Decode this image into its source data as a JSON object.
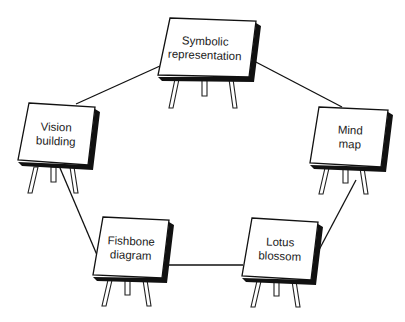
{
  "diagram": {
    "type": "cycle",
    "description_visible": "",
    "colors": {
      "line": "#111111",
      "board_fill": "#ffffff",
      "shadow": "#111111",
      "text": "#222222"
    },
    "nodes": [
      {
        "id": "symbolic",
        "line1": "Symbolic",
        "line2": "representation",
        "label_x": 205,
        "label_y": 48,
        "board": [
          [
            170,
            18
          ],
          [
            256,
            21
          ],
          [
            249,
            77
          ],
          [
            158,
            75
          ]
        ],
        "legs": [
          [
            [
              175,
              79
            ],
            [
              179,
              79
            ],
            [
              173,
              108
            ],
            [
              169,
              108
            ]
          ],
          [
            [
              202,
              79
            ],
            [
              207,
              79
            ],
            [
              207,
              96
            ],
            [
              202,
              96
            ]
          ],
          [
            [
              229,
              79
            ],
            [
              233,
              79
            ],
            [
              237,
              108
            ],
            [
              233,
              108
            ]
          ]
        ]
      },
      {
        "id": "mind",
        "line1": "Mind",
        "line2": "map",
        "label_x": 350,
        "label_y": 137,
        "board": [
          [
            319,
            107
          ],
          [
            388,
            110
          ],
          [
            381,
            167
          ],
          [
            310,
            163
          ]
        ],
        "legs": [
          [
            [
              325,
              168
            ],
            [
              329,
              168
            ],
            [
              323,
              194
            ],
            [
              319,
              194
            ]
          ],
          [
            [
              343,
              168
            ],
            [
              348,
              168
            ],
            [
              348,
              183
            ],
            [
              343,
              183
            ]
          ],
          [
            [
              360,
              168
            ],
            [
              364,
              168
            ],
            [
              368,
              194
            ],
            [
              364,
              194
            ]
          ]
        ]
      },
      {
        "id": "lotus",
        "line1": "Lotus",
        "line2": "blossom",
        "label_x": 280,
        "label_y": 249,
        "board": [
          [
            252,
            218
          ],
          [
            318,
            222
          ],
          [
            311,
            280
          ],
          [
            242,
            276
          ]
        ],
        "legs": [
          [
            [
              257,
              281
            ],
            [
              261,
              281
            ],
            [
              255,
              307
            ],
            [
              251,
              307
            ]
          ],
          [
            [
              274,
              281
            ],
            [
              279,
              281
            ],
            [
              279,
              296
            ],
            [
              274,
              296
            ]
          ],
          [
            [
              292,
              281
            ],
            [
              296,
              281
            ],
            [
              300,
              307
            ],
            [
              296,
              307
            ]
          ]
        ]
      },
      {
        "id": "fishbone",
        "line1": "Fishbone",
        "line2": "diagram",
        "label_x": 131,
        "label_y": 248,
        "board": [
          [
            103,
            217
          ],
          [
            169,
            220
          ],
          [
            162,
            278
          ],
          [
            93,
            275
          ]
        ],
        "legs": [
          [
            [
              108,
              280
            ],
            [
              112,
              280
            ],
            [
              106,
              306
            ],
            [
              102,
              306
            ]
          ],
          [
            [
              125,
              280
            ],
            [
              130,
              280
            ],
            [
              130,
              295
            ],
            [
              125,
              295
            ]
          ],
          [
            [
              143,
              280
            ],
            [
              147,
              280
            ],
            [
              151,
              306
            ],
            [
              147,
              306
            ]
          ]
        ]
      },
      {
        "id": "vision",
        "line1": "Vision",
        "line2": "building",
        "label_x": 56,
        "label_y": 134,
        "board": [
          [
            29,
            103
          ],
          [
            95,
            107
          ],
          [
            88,
            165
          ],
          [
            18,
            160
          ]
        ],
        "legs": [
          [
            [
              34,
              167
            ],
            [
              38,
              167
            ],
            [
              32,
              193
            ],
            [
              28,
              193
            ]
          ],
          [
            [
              51,
              167
            ],
            [
              56,
              167
            ],
            [
              56,
              182
            ],
            [
              51,
              182
            ]
          ],
          [
            [
              70,
              167
            ],
            [
              74,
              167
            ],
            [
              78,
              193
            ],
            [
              74,
              193
            ]
          ]
        ]
      }
    ],
    "edges": [
      {
        "from": "vision",
        "to": "symbolic",
        "x1": 76,
        "y1": 104,
        "x2": 160,
        "y2": 66
      },
      {
        "from": "symbolic",
        "to": "mind",
        "x1": 252,
        "y1": 60,
        "x2": 342,
        "y2": 107
      },
      {
        "from": "mind",
        "to": "lotus",
        "x1": 356,
        "y1": 180,
        "x2": 311,
        "y2": 265
      },
      {
        "from": "lotus",
        "to": "fishbone",
        "x1": 243,
        "y1": 265,
        "x2": 163,
        "y2": 265
      },
      {
        "from": "fishbone",
        "to": "vision",
        "x1": 97,
        "y1": 255,
        "x2": 60,
        "y2": 168
      }
    ]
  }
}
